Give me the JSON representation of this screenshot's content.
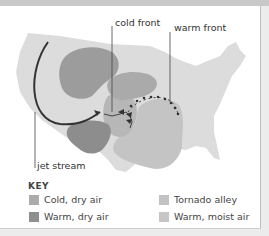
{
  "labels": {
    "cold_front": "cold front",
    "warm_front": "warm front",
    "jet_stream": "jet stream"
  },
  "key": {
    "title": "KEY",
    "items": [
      {
        "label": "Cold, dry air",
        "color": "#ababab"
      },
      {
        "label": "Warm, dry air",
        "color": "#8f8f8f"
      },
      {
        "label": "Tornado alley",
        "color": "#c2c2c2"
      },
      {
        "label": "Warm, moist air",
        "color": "#c6c6c6"
      }
    ]
  },
  "colors": {
    "land": "#dcdcdc",
    "cold_dry": "#9c9c9c",
    "warm_dry": "#8d8d8d",
    "tornado_alley": "#b5b5b5",
    "warm_moist": "#c4c4c4",
    "lines": "#333333"
  }
}
